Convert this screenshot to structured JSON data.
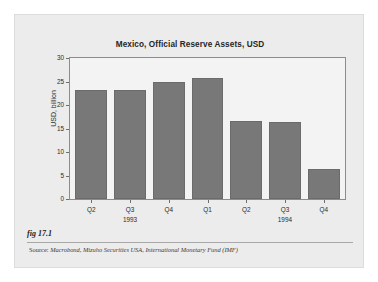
{
  "figure": {
    "label": "fig 17.1",
    "source_lead": "Source:",
    "source_text": "Macrobond, Mizuho Securities USA, International Monetary Fund (IMF)",
    "card_background": "#ececec",
    "page_background": "#ffffff"
  },
  "chart_data": {
    "type": "bar",
    "title": "Mexico, Official Reserve Assets, USD",
    "xlabel": "",
    "ylabel": "USD, billion",
    "categories": [
      "Q2",
      "Q3",
      "Q4",
      "Q1",
      "Q2",
      "Q3",
      "Q4"
    ],
    "group_labels": [
      {
        "text": "1993",
        "center_category_index": 1
      },
      {
        "text": "1994",
        "center_category_index": 5
      }
    ],
    "values": [
      23.2,
      23.2,
      24.9,
      25.8,
      16.5,
      16.4,
      6.3
    ],
    "ylim": [
      0,
      30
    ],
    "yticks": [
      0,
      5,
      10,
      15,
      20,
      25,
      30
    ],
    "ytick_labels": [
      "0",
      "5",
      "10",
      "15",
      "20",
      "25",
      "30"
    ],
    "grid": false,
    "legend": null,
    "bar_color": "#787878",
    "plot_background": "#f3f3f3",
    "axis_color": "#8c8c8c"
  }
}
